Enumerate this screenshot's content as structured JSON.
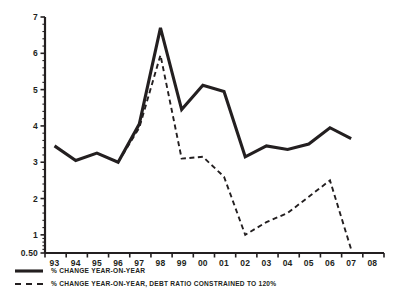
{
  "chart_data": {
    "type": "line",
    "title": "",
    "subtitle": "",
    "xlabel": "",
    "ylabel": "",
    "grid": false,
    "legend_position": "below-left",
    "x": [
      "93",
      "94",
      "95",
      "96",
      "97",
      "98",
      "99",
      "00",
      "01",
      "02",
      "03",
      "04",
      "05",
      "06",
      "07",
      "08"
    ],
    "categories": [
      "93",
      "94",
      "95",
      "96",
      "97",
      "98",
      "99",
      "00",
      "01",
      "02",
      "03",
      "04",
      "05",
      "06",
      "07",
      "08"
    ],
    "xtick_labels": [
      "93",
      "94",
      "95",
      "96",
      "97",
      "98",
      "99",
      "00",
      "01",
      "02",
      "03",
      "04",
      "05",
      "06",
      "07",
      "08"
    ],
    "ytick_labels": [
      "0.50",
      "1",
      "2",
      "3",
      "4",
      "5",
      "6",
      "7"
    ],
    "ytick_values": [
      0.5,
      1,
      2,
      3,
      4,
      5,
      6,
      7
    ],
    "ylim": [
      0.5,
      7
    ],
    "xlim": [
      "93",
      "08"
    ],
    "minor_ticks_per_unit": 5,
    "series": [
      {
        "name": "% CHANGE YEAR-ON-YEAR",
        "style": "solid",
        "color": "#231f20",
        "x": [
          "93",
          "94",
          "95",
          "96",
          "97",
          "98",
          "99",
          "00",
          "01",
          "02",
          "03",
          "04",
          "05",
          "06",
          "07"
        ],
        "values": [
          3.45,
          3.05,
          3.25,
          3.0,
          4.05,
          6.7,
          4.45,
          5.12,
          4.95,
          3.15,
          3.45,
          3.35,
          3.5,
          3.95,
          3.65
        ]
      },
      {
        "name": "% CHANGE YEAR-ON-YEAR, DEBT RATIO CONSTRAINED TO 120%",
        "style": "dashed",
        "color": "#231f20",
        "x": [
          "96",
          "97",
          "98",
          "99",
          "00",
          "01",
          "02",
          "03",
          "04",
          "05",
          "06",
          "07"
        ],
        "values": [
          3.0,
          3.95,
          5.95,
          3.1,
          3.15,
          2.6,
          1.0,
          1.35,
          1.6,
          2.05,
          2.5,
          0.6
        ]
      }
    ]
  },
  "legend": {
    "items": [
      {
        "label": "% CHANGE YEAR-ON-YEAR",
        "style": "solid"
      },
      {
        "label": "% CHANGE YEAR-ON-YEAR, DEBT RATIO CONSTRAINED TO 120%",
        "style": "dashed"
      }
    ]
  },
  "colors": {
    "ink": "#231f20",
    "background": "#ffffff"
  }
}
